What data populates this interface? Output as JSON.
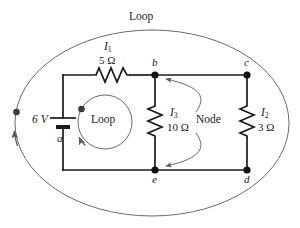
{
  "figure": {
    "kind": "circuit-diagram",
    "colors": {
      "wire": "#1a1a1a",
      "loop_path": "#6b6b6b",
      "text": "#1a1a1a",
      "background": "#ffffff"
    }
  },
  "annotations": {
    "outer_loop_label": "Loop",
    "inner_loop_label": "Loop",
    "node_label": "Node"
  },
  "source": {
    "name": "battery",
    "voltage_label": "6 V",
    "voltage_value": 6,
    "voltage_unit": "V"
  },
  "currents": [
    {
      "id": "I1",
      "symbol": "I",
      "subscript": "1",
      "branch": "a-b via 5 ohm"
    },
    {
      "id": "I3",
      "symbol": "I",
      "subscript": "3",
      "branch": "b-e via 10 ohm"
    },
    {
      "id": "I2",
      "symbol": "I",
      "subscript": "2",
      "branch": "c-d via 3 ohm"
    }
  ],
  "resistors": [
    {
      "id": "R1",
      "label": "5 Ω",
      "value": 5,
      "unit": "Ω",
      "orientation": "horizontal",
      "current": "I1"
    },
    {
      "id": "R3",
      "label": "10 Ω",
      "value": 10,
      "unit": "Ω",
      "orientation": "vertical",
      "current": "I3"
    },
    {
      "id": "R2",
      "label": "3 Ω",
      "value": 3,
      "unit": "Ω",
      "orientation": "vertical",
      "current": "I2"
    }
  ],
  "nodes": [
    {
      "id": "a",
      "label": "a",
      "x": 63,
      "y": 126
    },
    {
      "id": "b",
      "label": "b",
      "x": 155,
      "y": 75
    },
    {
      "id": "c",
      "label": "c",
      "x": 247,
      "y": 75
    },
    {
      "id": "d",
      "label": "d",
      "x": 247,
      "y": 170
    },
    {
      "id": "e",
      "label": "e",
      "x": 155,
      "y": 170
    }
  ]
}
